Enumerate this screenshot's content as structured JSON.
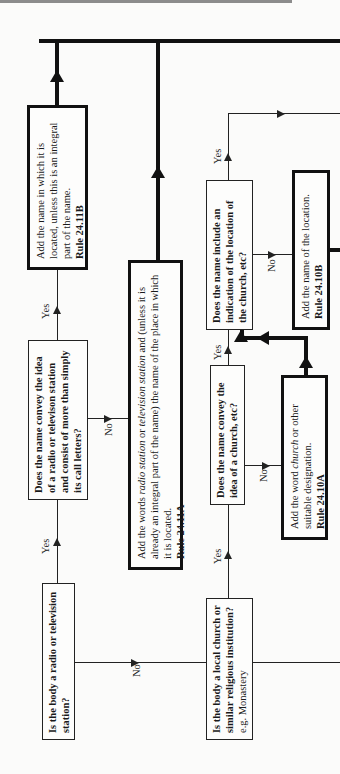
{
  "flowchart": {
    "orientation": "rotated 90 degrees counterclockwise",
    "nodes": {
      "q_radio": {
        "text": "Is the body a radio or television station?"
      },
      "q_radio_idea": {
        "text": "Does the name convey the idea of a radio or televison station and consist of more than simply its call letters?"
      },
      "a_add_name_located": {
        "text": "Add the name in which it is located, unless this is an integral part of the name.",
        "rule": "Rule 24.11B"
      },
      "a_add_radio_words": {
        "text_1": "Add the words ",
        "text_italic_1": "radio station",
        "text_2": " or ",
        "text_italic_2": "television station",
        "text_3": " and (unless it is already an integral part of the name) the name of the place in which it is located.",
        "rule": "Rule 24.11A"
      },
      "q_church": {
        "text": "Is the body a local church or similar religious institution?",
        "note": "e.g. Monastery"
      },
      "q_church_idea": {
        "text": "Does the name convey the idea of a church, etc?"
      },
      "a_add_church_word": {
        "text_1": "Add the word ",
        "text_italic": "church",
        "text_2": " or other suitable designation.",
        "rule": "Rule 24.10A"
      },
      "q_location": {
        "text": "Does the name include an indication of the location of the church, etc?"
      },
      "a_add_location": {
        "text": "Add the name of the location.",
        "rule": "Rule 24.10B"
      }
    },
    "labels": {
      "yes": "Yes",
      "no": "No"
    }
  }
}
